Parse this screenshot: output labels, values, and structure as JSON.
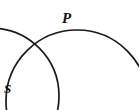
{
  "figure": {
    "background_color": "#ffffff",
    "stroke_color": "#1a1a1a",
    "width": 139,
    "height": 110,
    "labels": {
      "point_p": "P",
      "point_s": "S"
    },
    "shapes": {
      "left_circle": {
        "name": "left-circle",
        "center_x": -9,
        "center_y": 96,
        "radius": 68,
        "stroke_width": 1.7
      },
      "right_circle": {
        "name": "right-circle",
        "center_x": 77,
        "center_y": 101,
        "radius": 71,
        "stroke_width": 1.7
      }
    },
    "label_positions": {
      "point_p": {
        "x": 68,
        "y": 18
      },
      "point_s": {
        "x": 9,
        "y": 89
      }
    }
  }
}
